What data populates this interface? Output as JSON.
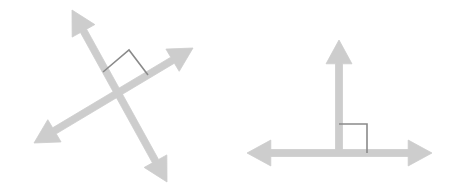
{
  "figure": {
    "background_color": "#ffffff",
    "width": 457,
    "height": 193,
    "line_color": "#cdcdcd",
    "line_color_light": "#d4d4d4",
    "marker_color_dark": "#8a8a8a",
    "marker_color_light": "#b9b9b9",
    "stroke_width": 7,
    "marker_stroke_width": 1.6
  },
  "diagrams": [
    {
      "name": "oblique-perpendicular-pair",
      "label": "Left figure: two oblique intersecting lines",
      "intersection": {
        "x": 115,
        "y": 98
      },
      "lines": [
        {
          "name": "line-steep-up-right",
          "label": "Steep line rising to upper-left, descending to lower-right",
          "x1": 72,
          "y1": 10,
          "x2": 167,
          "y2": 182,
          "arrowheads": "both",
          "color": "#cdcdcd"
        },
        {
          "name": "line-shallow-up-right",
          "label": "Shallow line rising to upper-right, descending to lower-left",
          "x1": 34,
          "y1": 143,
          "x2": 193,
          "y2": 48,
          "arrowheads": "both",
          "color": "#cdcdcd"
        }
      ],
      "right_angle_marker": {
        "name": "right-angle-marker-rotated",
        "label": "Rotated square right-angle marker",
        "color": "#8a8a8a",
        "points": "103,72 129,50 148,75"
      }
    },
    {
      "name": "axis-perpendicular-pair",
      "label": "Right figure: vertical ray meeting horizontal line",
      "intersection": {
        "x": 339,
        "y": 153
      },
      "lines": [
        {
          "name": "line-vertical-ray",
          "label": "Vertical ray pointing up",
          "x1": 339,
          "y1": 153,
          "x2": 339,
          "y2": 40,
          "arrowheads": "end",
          "color": "#cdcdcd"
        },
        {
          "name": "line-horizontal",
          "label": "Horizontal line with arrowheads both ends",
          "x1": 247,
          "y1": 153,
          "x2": 432,
          "y2": 153,
          "arrowheads": "both",
          "color": "#cdcdcd"
        }
      ],
      "right_angle_marker": {
        "name": "right-angle-marker-square",
        "label": "Axis-aligned square right-angle marker",
        "color": "#8a8a8a",
        "points": "339,124 367,124 367,153"
      }
    }
  ]
}
